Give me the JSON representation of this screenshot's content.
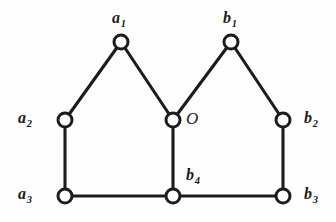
{
  "figure": {
    "background_color": "#fefefe",
    "stroke_color": "#1c1c1c",
    "vertex_fill_color": "#ffffff",
    "width": 336,
    "height": 222
  },
  "chart_data": {
    "type": "diagram",
    "title": "",
    "xlabel": "",
    "ylabel": "",
    "grid": false,
    "legend": null,
    "nodes": [
      {
        "id": "a1",
        "label": "a",
        "subscript": "1",
        "x": 121,
        "y": 42,
        "label_x": 112,
        "label_y": 10,
        "radius": 7.0
      },
      {
        "id": "b1",
        "label": "b",
        "subscript": "1",
        "x": 231,
        "y": 42,
        "label_x": 223,
        "label_y": 10,
        "radius": 7.0
      },
      {
        "id": "a2",
        "label": "a",
        "subscript": "2",
        "x": 65,
        "y": 120,
        "label_x": 18,
        "label_y": 110,
        "radius": 7.0
      },
      {
        "id": "O",
        "label": "O",
        "subscript": "",
        "x": 173,
        "y": 120,
        "label_x": 186,
        "label_y": 110,
        "radius": 7.0
      },
      {
        "id": "b2",
        "label": "b",
        "subscript": "2",
        "x": 283,
        "y": 120,
        "label_x": 304,
        "label_y": 110,
        "radius": 7.0
      },
      {
        "id": "a3",
        "label": "a",
        "subscript": "3",
        "x": 65,
        "y": 196,
        "label_x": 18,
        "label_y": 186,
        "radius": 7.0
      },
      {
        "id": "b4",
        "label": "b",
        "subscript": "4",
        "x": 173,
        "y": 196,
        "label_x": 186,
        "label_y": 167,
        "radius": 7.0
      },
      {
        "id": "b3",
        "label": "b",
        "subscript": "3",
        "x": 283,
        "y": 196,
        "label_x": 304,
        "label_y": 186,
        "radius": 7.0
      }
    ],
    "edges": [
      {
        "from": "a2",
        "to": "a1"
      },
      {
        "from": "a1",
        "to": "O"
      },
      {
        "from": "O",
        "to": "b1"
      },
      {
        "from": "b1",
        "to": "b2"
      },
      {
        "from": "a2",
        "to": "a3"
      },
      {
        "from": "O",
        "to": "b4"
      },
      {
        "from": "b2",
        "to": "b3"
      },
      {
        "from": "a3",
        "to": "b4"
      },
      {
        "from": "b4",
        "to": "b3"
      }
    ]
  }
}
